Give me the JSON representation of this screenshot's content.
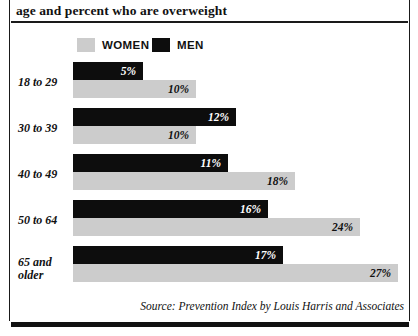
{
  "title": "age and percent who are overweight",
  "legend": {
    "items": [
      {
        "label": "WOMEN",
        "color": "#cccccc",
        "series": "women"
      },
      {
        "label": "MEN",
        "color": "#0d0d0d",
        "series": "men"
      }
    ]
  },
  "source": "Source: Prevention Index by Louis Harris and Associates",
  "chart_data": {
    "type": "bar",
    "orientation": "horizontal",
    "title": "age and percent who are overweight",
    "xlabel": "",
    "ylabel": "",
    "grid": false,
    "legend_position": "top",
    "categories": [
      "18 to 29",
      "30 to 39",
      "40 to 49",
      "50 to 64",
      "65 and older"
    ],
    "series": [
      {
        "name": "MEN",
        "color": "#0d0d0d",
        "values": [
          5,
          12,
          11,
          16,
          17
        ],
        "labels": [
          "5%",
          "12%",
          "11%",
          "16%",
          "17%"
        ]
      },
      {
        "name": "WOMEN",
        "color": "#cccccc",
        "values": [
          10,
          10,
          18,
          24,
          27
        ],
        "labels": [
          "10%",
          "10%",
          "18%",
          "24%",
          "27%"
        ]
      }
    ],
    "note": "Bar lengths as drawn are not strictly proportional to the stated percentages."
  },
  "rows": [
    {
      "label": "18 to 29",
      "label_top": 76,
      "men": {
        "value": "5%",
        "top": 62,
        "width": 70
      },
      "women": {
        "value": "10%",
        "top": 80,
        "width": 123
      }
    },
    {
      "label": "30 to 39",
      "label_top": 122,
      "men": {
        "value": "12%",
        "top": 108,
        "width": 163
      },
      "women": {
        "value": "10%",
        "top": 126,
        "width": 123
      }
    },
    {
      "label": "40 to 49",
      "label_top": 168,
      "men": {
        "value": "11%",
        "top": 154,
        "width": 155
      },
      "women": {
        "value": "18%",
        "top": 172,
        "width": 222
      }
    },
    {
      "label": "50 to 64",
      "label_top": 214,
      "men": {
        "value": "16%",
        "top": 200,
        "width": 195
      },
      "women": {
        "value": "24%",
        "top": 218,
        "width": 287
      }
    },
    {
      "label": "65 and\nolder",
      "label_top": 256,
      "men": {
        "value": "17%",
        "top": 246,
        "width": 210
      },
      "women": {
        "value": "27%",
        "top": 264,
        "width": 325
      }
    }
  ]
}
